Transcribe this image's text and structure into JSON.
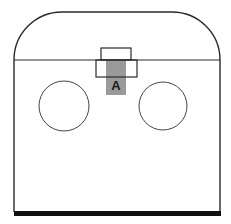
{
  "diagram": {
    "labels": {
      "component_a": "A"
    },
    "colors": {
      "stroke": "#2a2a2a",
      "highlight_fill": "#9a9a9a",
      "base_bar": "#111111",
      "background": "#ffffff"
    },
    "shapes": {
      "enclosure": {
        "left": 14,
        "right": 220,
        "top": 12,
        "divider_y": 60,
        "bottom": 212,
        "corner_radius": 48
      },
      "upper_box": {
        "x": 101,
        "y": 48,
        "w": 30,
        "h": 12
      },
      "lower_box": {
        "x": 96,
        "y": 60,
        "w": 41,
        "h": 17
      },
      "highlight": {
        "x": 106,
        "y": 60,
        "w": 20,
        "h": 35
      },
      "left_circle": {
        "cx": 64,
        "cy": 106,
        "r": 25
      },
      "right_circle": {
        "cx": 163,
        "cy": 106,
        "r": 24
      },
      "base_bar": {
        "x": 14,
        "y": 211,
        "w": 207,
        "h": 5
      }
    }
  }
}
